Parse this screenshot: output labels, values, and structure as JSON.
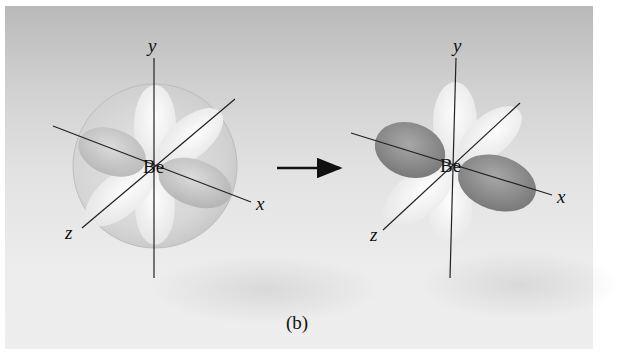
{
  "figure": {
    "caption": "(b)",
    "left": {
      "title": "Be atom before hybridization",
      "atom": "Be",
      "axes": {
        "x": "x",
        "y": "y",
        "z": "z"
      },
      "shapes": [
        "translucent-sphere (2s)",
        "white-p-lobe-y",
        "white-p-lobe-z",
        "gray-p-lobe-x"
      ]
    },
    "arrow": {
      "direction": "right"
    },
    "right": {
      "title": "Be atom after sp hybridization",
      "atom": "Be",
      "axes": {
        "x": "x",
        "y": "y",
        "z": "z"
      },
      "shapes": [
        "dark-sp-hybrid-lobe-left",
        "dark-sp-hybrid-lobe-right",
        "white-p-lobe-y",
        "white-p-lobe-z"
      ]
    },
    "colors": {
      "background_top": "#b9b9b9",
      "background_bottom": "#eeeeee",
      "dark_lobe": "#8a8a8a",
      "light_lobe": "#f4f4f4",
      "axis_line": "#222222"
    }
  }
}
